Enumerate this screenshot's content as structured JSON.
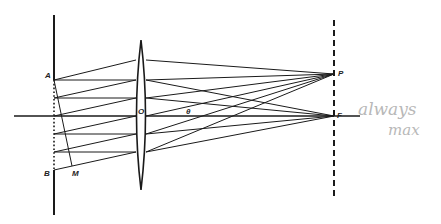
{
  "figure": {
    "colors": {
      "ink": "#1a1a1a",
      "annotation": "#b8b8b8",
      "background": "#ffffff"
    },
    "labels": {
      "A": "A",
      "B": "B",
      "M": "M",
      "O": "O",
      "theta": "θ",
      "P": "P",
      "F": "F"
    },
    "annotation": {
      "line1": "always",
      "line2": "max"
    },
    "geometry": {
      "axis": {
        "x1": 14,
        "x2": 360,
        "y": 116
      },
      "slit_screen": {
        "x": 54,
        "y_top": 15,
        "y_bottom": 215,
        "A_y": 80,
        "B_y": 170
      },
      "lens": {
        "cx": 141,
        "y_top": 40,
        "y_bottom": 190,
        "half_width": 7
      },
      "focal_screen": {
        "x": 334,
        "y_top": 20,
        "y_bottom": 198
      },
      "P": {
        "x": 334,
        "y": 74
      },
      "F": {
        "x": 334,
        "y": 116
      },
      "parallel_rays_y": [
        80,
        98,
        116,
        134,
        152
      ],
      "oblique_rays": [
        {
          "from_y": 80,
          "to_y": 60
        },
        {
          "from_y": 98,
          "to_y": 80
        },
        {
          "from_y": 116,
          "to_y": 98
        },
        {
          "from_y": 134,
          "to_y": 116
        },
        {
          "from_y": 152,
          "to_y": 134
        },
        {
          "from_y": 170,
          "to_y": 152
        }
      ]
    }
  }
}
